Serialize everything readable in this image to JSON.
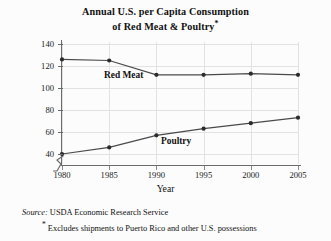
{
  "chart_data": {
    "type": "line",
    "title_line1": "Annual U.S. per Capita Consumption",
    "title_line2": "of Red Meat & Poultry",
    "title_asterisk": "*",
    "xlabel": "Year",
    "ylabel": "Pounds",
    "x": [
      1980,
      1985,
      1990,
      1995,
      2000,
      2005
    ],
    "xticklabels": [
      "1980",
      "1985",
      "1990",
      "1995",
      "2000",
      "2005"
    ],
    "yticks": [
      40,
      60,
      80,
      100,
      120,
      140
    ],
    "yticklabels": [
      "40",
      "60",
      "80",
      "100",
      "120",
      "140"
    ],
    "ylim": [
      36,
      145
    ],
    "xlim": [
      1980,
      2005
    ],
    "y_axis_break": true,
    "grid": true,
    "grid_color": "#e2e2e2",
    "legend": "inline-labels",
    "series": [
      {
        "name": "Red Meat",
        "label": "Red Meat",
        "color": "#4a4a4a",
        "values": [
          126,
          125,
          112,
          112,
          113,
          112
        ]
      },
      {
        "name": "Poultry",
        "label": "Poultry",
        "color": "#4a4a4a",
        "values": [
          40,
          46,
          57,
          63,
          68,
          73
        ]
      }
    ],
    "annotations": [
      "Source: USDA Economic Research Service",
      "* Excludes shipments to Puerto Rico and other U.S. possessions"
    ]
  },
  "footnotes": {
    "source_label": "Source:",
    "source_text": "USDA Economic Research Service",
    "asterisk": "*",
    "excludes_text": "Excludes shipments to Puerto Rico and other U.S. possessions"
  },
  "colors": {
    "background": "#fcfcfc",
    "axis": "#6b6b6b",
    "grid": "#e2e2e2",
    "line": "#4a4a4a",
    "marker": "#2b2b2b",
    "text": "#111111"
  }
}
